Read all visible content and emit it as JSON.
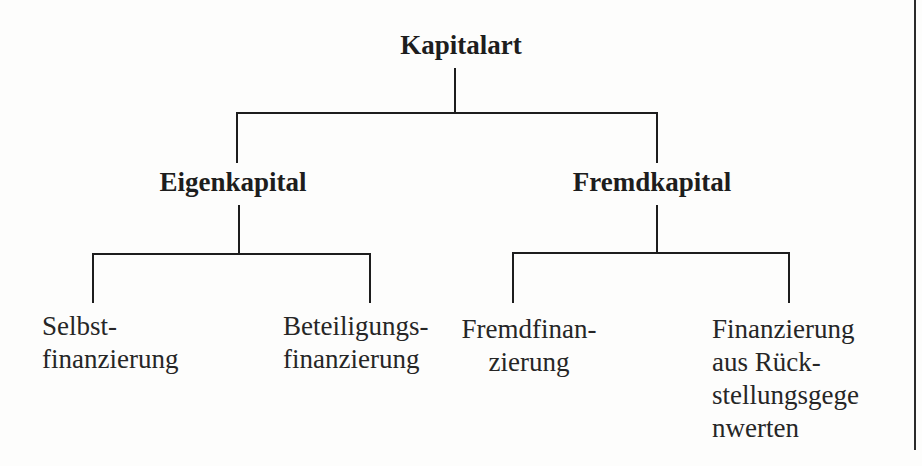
{
  "figure": {
    "colors": {
      "ink": "#1d1d1d",
      "background": "#fdfdfc",
      "page_rule": "#2b2b2b"
    }
  },
  "tree": {
    "root": {
      "label": "Kapitalart"
    },
    "branches": [
      {
        "label": "Eigenkapital",
        "children": [
          {
            "lines": [
              "Selbst-",
              "finanzierung"
            ]
          },
          {
            "lines": [
              "Beteiligungs-",
              "finanzierung"
            ]
          }
        ]
      },
      {
        "label": "Fremdkapital",
        "children": [
          {
            "lines": [
              "Fremdfinan-",
              "zierung"
            ]
          },
          {
            "lines": [
              "Finanzierung",
              "aus Rück-",
              "stellungsgege",
              "nwerten"
            ]
          }
        ]
      }
    ]
  }
}
